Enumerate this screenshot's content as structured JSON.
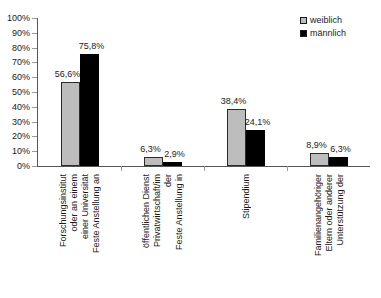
{
  "chart_data": {
    "type": "bar",
    "title": "",
    "xlabel": "",
    "ylabel": "",
    "ylim": [
      0,
      100
    ],
    "grid": false,
    "legend_position": "top-right",
    "categories": [
      "Feste Anstellung an einer Universität oder an einem Forschungsinstitut",
      "Feste Anstellung in der Privatwirtschaft/im öffentlichen Dienst",
      "Stipendium",
      "Unterstützung der Eltern oder anderer Familienangehöriger"
    ],
    "category_lines": [
      [
        "Feste Anstellung an",
        "einer Universität",
        "oder an einem",
        "Forschungsinstitut"
      ],
      [
        "Feste Anstellung in",
        "der",
        "Privatwirtschaft/im",
        "öffentlichen Dienst"
      ],
      [
        "Stipendium"
      ],
      [
        "Unterstützung der",
        "Eltern oder anderer",
        "Familienangehöriger"
      ]
    ],
    "series": [
      {
        "name": "weiblich",
        "color": "#bdbdbd",
        "values": [
          56.6,
          6.3,
          38.4,
          8.9
        ],
        "labels": [
          "56,6%",
          "6,3%",
          "38,4%",
          "8,9%"
        ]
      },
      {
        "name": "männlich",
        "color": "#000000",
        "values": [
          75.8,
          2.9,
          24.1,
          6.3
        ],
        "labels": [
          "75,8%",
          "2,9%",
          "24,1%",
          "6,3%"
        ]
      }
    ],
    "y_ticks": [
      0,
      10,
      20,
      30,
      40,
      50,
      60,
      70,
      80,
      90,
      100
    ],
    "y_tick_labels": [
      "0%",
      "10%",
      "20%",
      "30%",
      "40%",
      "50%",
      "60%",
      "70%",
      "80%",
      "90%",
      "100%"
    ]
  },
  "legend": {
    "items": [
      {
        "label": "weiblich"
      },
      {
        "label": "männlich"
      }
    ]
  }
}
